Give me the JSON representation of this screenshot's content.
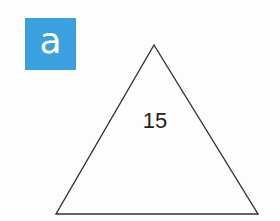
{
  "badge": {
    "label": "a",
    "color": "#3aa0e0"
  },
  "triangle": {
    "value": "15",
    "stroke_color": "#333333"
  }
}
